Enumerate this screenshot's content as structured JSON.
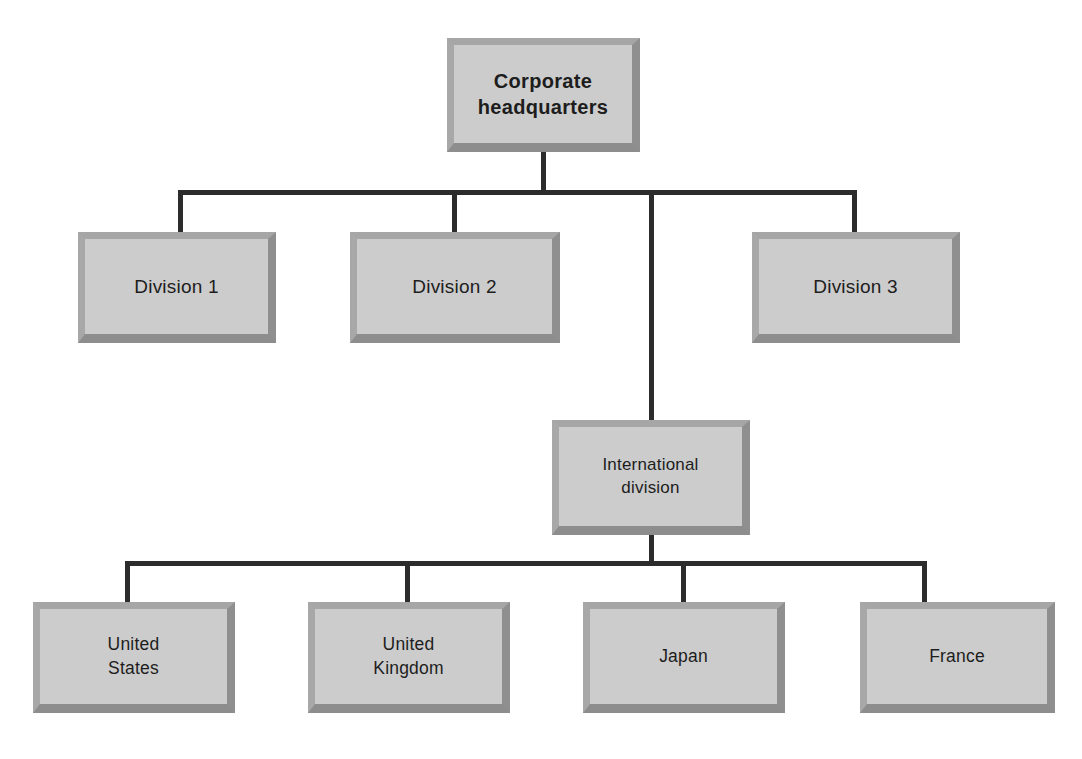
{
  "diagram": {
    "type": "organizational-chart",
    "colors": {
      "box_fill": "#cccccc",
      "box_border_light": "#a8a8a8",
      "box_border_dark": "#8d8d8d",
      "connector": "#2c2c2c",
      "text": "#1d1d1d",
      "background": "#ffffff"
    }
  },
  "nodes": {
    "root": {
      "label": "Corporate\nheadquarters",
      "level": "root",
      "bold": true
    },
    "divisions": [
      {
        "label": "Division 1",
        "level": "division"
      },
      {
        "label": "Division 2",
        "level": "division"
      },
      {
        "label": "Division 3",
        "level": "division"
      }
    ],
    "international": {
      "label": "International\ndivision",
      "level": "international"
    },
    "countries": [
      {
        "label": "United\nStates",
        "level": "country"
      },
      {
        "label": "United\nKingdom",
        "level": "country"
      },
      {
        "label": "Japan",
        "level": "country"
      },
      {
        "label": "France",
        "level": "country"
      }
    ]
  },
  "hierarchy": {
    "root_children": [
      "Division 1",
      "Division 2",
      "International division",
      "Division 3"
    ],
    "international_children": [
      "United States",
      "United Kingdom",
      "Japan",
      "France"
    ]
  }
}
